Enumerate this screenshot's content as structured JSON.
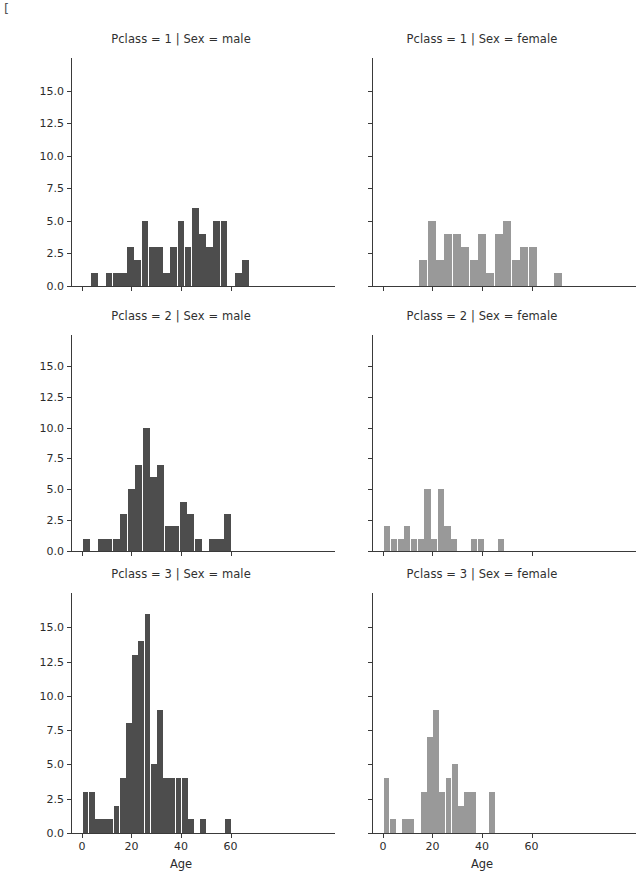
{
  "figure": {
    "width": 599,
    "height": 895,
    "background": "#ffffff",
    "corner_mark": "[",
    "rows": 3,
    "cols": 2
  },
  "style": {
    "bar_color_male": "#4d4d4d",
    "bar_color_female": "#999999",
    "axis_color": "#3a3a3a",
    "text_color": "#2b2b2b"
  },
  "axis": {
    "xlabel": "Age",
    "ylabel": "",
    "xticks": [
      0,
      20,
      40,
      60
    ],
    "xtick_labels": [
      "0",
      "20",
      "40",
      "60"
    ],
    "yticks": [
      0.0,
      2.5,
      5.0,
      7.5,
      10.0,
      12.5,
      15.0
    ],
    "ytick_labels": [
      "0.0",
      "2.5",
      "5.0",
      "7.5",
      "10.0",
      "12.5",
      "15.0"
    ],
    "xlim": [
      -4,
      84
    ],
    "ylim": [
      0,
      17.5
    ],
    "grid": false
  },
  "chart_data": {
    "type": "bar",
    "title": "",
    "subtitle": "",
    "xlabel": "Age",
    "ylabel": "",
    "xlim": [
      -4,
      84
    ],
    "ylim": [
      0,
      17.5
    ],
    "grid": false,
    "legend": "none",
    "bin_width": 2.9,
    "note": "FacetGrid of Age histograms by Pclass (rows) and Sex (columns); Titanic dataset",
    "facets": [
      {
        "row": 0,
        "col": 0,
        "title": "Pclass = 1 | Sex = male",
        "pclass": 1,
        "sex": "male",
        "color": "#4d4d4d",
        "bins_left": [
          0.9,
          3.8,
          6.7,
          9.6,
          12.5,
          15.4,
          18.3,
          21.2,
          24.1,
          27.0,
          29.9,
          32.8,
          35.7,
          38.6,
          41.5,
          44.4,
          47.3,
          50.2,
          53.1,
          56.0,
          58.9,
          61.8,
          64.7,
          67.6
        ],
        "values": [
          0,
          1,
          0,
          1,
          1,
          1,
          3,
          2,
          5,
          3,
          3,
          1,
          3,
          5,
          3,
          6,
          4,
          3,
          5,
          5,
          0,
          1,
          2,
          0
        ]
      },
      {
        "row": 0,
        "col": 1,
        "title": "Pclass = 1 | Sex = female",
        "pclass": 1,
        "sex": "female",
        "color": "#999999",
        "bins_left": [
          1.0,
          4.4,
          7.8,
          11.2,
          14.6,
          18.0,
          21.4,
          24.8,
          28.2,
          31.6,
          35.0,
          38.4,
          41.8,
          45.2,
          48.6,
          52.0,
          55.4,
          58.8,
          62.2,
          65.6,
          69.0,
          72.4
        ],
        "values": [
          0,
          0,
          0,
          0,
          2,
          5,
          2,
          4,
          4,
          3,
          2,
          4,
          1,
          4,
          5,
          2,
          3,
          3,
          0,
          0,
          1,
          0
        ]
      },
      {
        "row": 1,
        "col": 0,
        "title": "Pclass = 2 | Sex = male",
        "pclass": 2,
        "sex": "male",
        "color": "#4d4d4d",
        "bins_left": [
          0.5,
          3.5,
          6.5,
          9.5,
          12.5,
          15.5,
          18.5,
          21.5,
          24.5,
          27.5,
          30.5,
          33.5,
          36.5,
          39.5,
          42.5,
          45.5,
          48.5,
          51.5,
          54.5,
          57.5,
          60.5,
          63.5
        ],
        "values": [
          1,
          0,
          1,
          1,
          1,
          3,
          5,
          7,
          10,
          6,
          7,
          2,
          2,
          4,
          3,
          1,
          0,
          1,
          1,
          3,
          0,
          0
        ]
      },
      {
        "row": 1,
        "col": 1,
        "title": "Pclass = 2 | Sex = female",
        "pclass": 2,
        "sex": "female",
        "color": "#999999",
        "bins_left": [
          0.5,
          3.2,
          5.9,
          8.6,
          11.3,
          14.0,
          16.7,
          19.4,
          22.1,
          24.8,
          27.5,
          30.2,
          32.9,
          35.6,
          38.3,
          41.0,
          43.7,
          46.4,
          49.1,
          51.8,
          54.5,
          57.2
        ],
        "values": [
          2,
          1,
          1,
          2,
          1,
          1,
          5,
          1,
          5,
          2,
          1,
          0,
          0,
          1,
          1,
          0,
          0,
          1,
          0,
          0,
          0,
          0
        ]
      },
      {
        "row": 2,
        "col": 0,
        "title": "Pclass = 3 | Sex = male",
        "pclass": 3,
        "sex": "male",
        "color": "#4d4d4d",
        "bins_left": [
          0.3,
          2.8,
          5.3,
          7.8,
          10.3,
          12.8,
          15.3,
          17.8,
          20.3,
          22.8,
          25.3,
          27.8,
          30.3,
          32.8,
          35.3,
          37.8,
          40.3,
          42.8,
          45.3,
          47.8,
          50.3,
          52.8,
          55.3,
          57.8,
          60.3
        ],
        "values": [
          3,
          3,
          1,
          1,
          1,
          2,
          4,
          8,
          13,
          14,
          16,
          5,
          9,
          4,
          4,
          4,
          4,
          1,
          0,
          1,
          0,
          0,
          0,
          1,
          0
        ]
      },
      {
        "row": 2,
        "col": 1,
        "title": "Pclass = 3 | Sex = female",
        "pclass": 3,
        "sex": "female",
        "color": "#999999",
        "bins_left": [
          0.3,
          2.8,
          5.3,
          7.8,
          10.3,
          12.8,
          15.3,
          17.8,
          20.3,
          22.8,
          25.3,
          27.8,
          30.3,
          32.8,
          35.3,
          37.8,
          40.3,
          42.8,
          45.3,
          47.8
        ],
        "values": [
          4,
          1,
          0,
          1,
          1,
          0,
          3,
          7,
          9,
          3,
          4,
          5,
          2,
          3,
          3,
          0,
          0,
          3,
          0,
          0
        ]
      }
    ]
  }
}
